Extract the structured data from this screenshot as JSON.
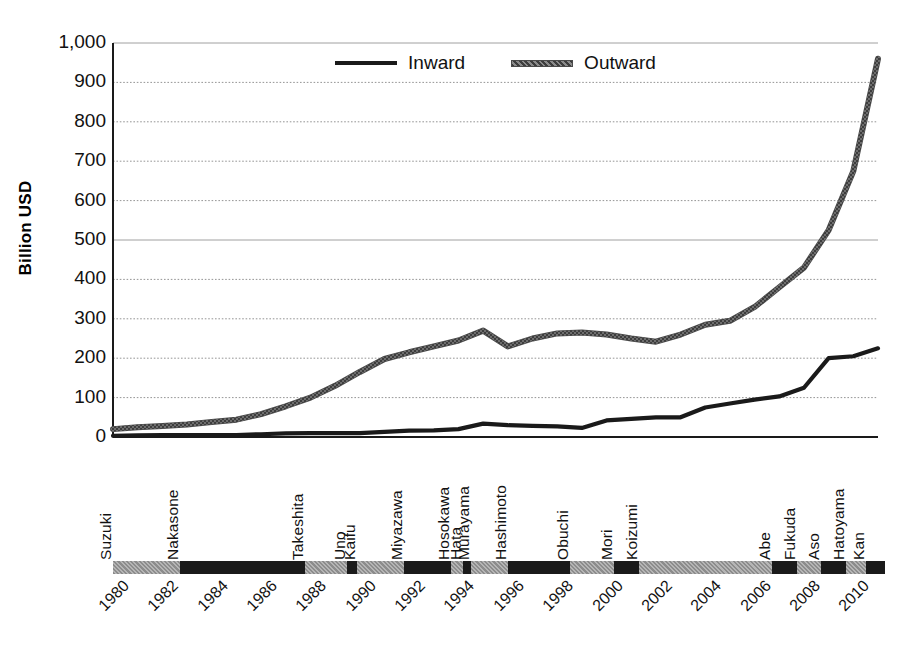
{
  "chart_data": {
    "type": "line",
    "title": "",
    "xlabel": "",
    "ylabel": "Billion USD",
    "ylim": [
      0,
      1000
    ],
    "xlim": [
      1980,
      2011
    ],
    "grid": true,
    "legend_position": "top-center",
    "y_ticks": [
      "0",
      "100",
      "200",
      "300",
      "400",
      "500",
      "600",
      "700",
      "800",
      "900",
      "1,000"
    ],
    "y_tick_values": [
      0,
      100,
      200,
      300,
      400,
      500,
      600,
      700,
      800,
      900,
      1000
    ],
    "x_tick_labels": [
      "1980",
      "1982",
      "1984",
      "1986",
      "1988",
      "1990",
      "1992",
      "1994",
      "1996",
      "1998",
      "2000",
      "2002",
      "2004",
      "2006",
      "2008",
      "2010"
    ],
    "x_tick_values": [
      1980,
      1982,
      1984,
      1986,
      1988,
      1990,
      1992,
      1994,
      1996,
      1998,
      2000,
      2002,
      2004,
      2006,
      2008,
      2010
    ],
    "x": [
      1980,
      1981,
      1982,
      1983,
      1984,
      1985,
      1986,
      1987,
      1988,
      1989,
      1990,
      1991,
      1992,
      1993,
      1994,
      1995,
      1996,
      1997,
      1998,
      1999,
      2000,
      2001,
      2002,
      2003,
      2004,
      2005,
      2006,
      2007,
      2008,
      2009,
      2010,
      2011
    ],
    "series": [
      {
        "name": "Inward",
        "color": "#1a1a1a",
        "style": "solid",
        "values": [
          3,
          4,
          5,
          5,
          5,
          5,
          7,
          9,
          10,
          10,
          10,
          13,
          16,
          17,
          20,
          34,
          30,
          28,
          27,
          23,
          42,
          46,
          50,
          50,
          75,
          85,
          95,
          103,
          125,
          200,
          205,
          225
        ]
      },
      {
        "name": "Outward",
        "color": "#6b6b6b",
        "style": "textured",
        "values": [
          20,
          25,
          28,
          32,
          38,
          44,
          58,
          78,
          100,
          130,
          165,
          198,
          215,
          230,
          245,
          270,
          230,
          250,
          263,
          265,
          260,
          250,
          242,
          260,
          285,
          295,
          330,
          380,
          430,
          525,
          675,
          960
        ]
      }
    ]
  },
  "legend": {
    "items": [
      {
        "label": "Inward",
        "color": "#1a1a1a",
        "style": "solid"
      },
      {
        "label": "Outward",
        "color": "#6b6b6b",
        "style": "textured"
      }
    ]
  },
  "pm_axis": {
    "color_gray": "#9e9e9e",
    "color_black": "#1a1a1a",
    "segments": [
      {
        "name": "Suzuki",
        "start": 1980.0,
        "end": 1982.7,
        "shade": "gray"
      },
      {
        "name": "Nakasone",
        "start": 1982.7,
        "end": 1987.8,
        "shade": "black"
      },
      {
        "name": "Takeshita",
        "start": 1987.8,
        "end": 1989.5,
        "shade": "gray"
      },
      {
        "name": "Uno",
        "start": 1989.5,
        "end": 1989.9,
        "shade": "black"
      },
      {
        "name": "Kaifu",
        "start": 1989.9,
        "end": 1991.8,
        "shade": "gray"
      },
      {
        "name": "Miyazawa",
        "start": 1991.8,
        "end": 1993.7,
        "shade": "black"
      },
      {
        "name": "Hosokawa",
        "start": 1993.7,
        "end": 1994.2,
        "shade": "gray"
      },
      {
        "name": "Hata",
        "start": 1994.2,
        "end": 1994.5,
        "shade": "black"
      },
      {
        "name": "Murayama",
        "start": 1994.5,
        "end": 1996.0,
        "shade": "gray"
      },
      {
        "name": "Hashimoto",
        "start": 1996.0,
        "end": 1998.5,
        "shade": "black"
      },
      {
        "name": "Obuchi",
        "start": 1998.5,
        "end": 2000.3,
        "shade": "gray"
      },
      {
        "name": "Mori",
        "start": 2000.3,
        "end": 2001.3,
        "shade": "black"
      },
      {
        "name": "Koizumi",
        "start": 2001.3,
        "end": 2006.7,
        "shade": "gray"
      },
      {
        "name": "Abe",
        "start": 2006.7,
        "end": 2007.7,
        "shade": "black"
      },
      {
        "name": "Fukuda",
        "start": 2007.7,
        "end": 2008.7,
        "shade": "gray"
      },
      {
        "name": "Aso",
        "start": 2008.7,
        "end": 2009.7,
        "shade": "black"
      },
      {
        "name": "Hatoyama",
        "start": 2009.7,
        "end": 2010.5,
        "shade": "gray"
      },
      {
        "name": "Kan",
        "start": 2010.5,
        "end": 2011.3,
        "shade": "black"
      }
    ]
  }
}
